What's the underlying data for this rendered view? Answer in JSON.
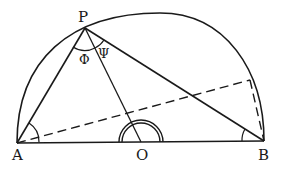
{
  "figure": {
    "type": "geometry-diagram",
    "colors": {
      "ink": "#1a1a1a",
      "background": "#ffffff"
    },
    "points": {
      "A": {
        "label": "A",
        "x": 17,
        "y": 143
      },
      "B": {
        "label": "B",
        "x": 264,
        "y": 141
      },
      "O": {
        "label": "O",
        "x": 141,
        "y": 142
      },
      "P": {
        "label": "P",
        "x": 85,
        "y": 28
      },
      "Q": {
        "label": "",
        "x": 250,
        "y": 80
      }
    },
    "angle_labels": {
      "phi": "Φ",
      "psi": "Ψ"
    }
  }
}
